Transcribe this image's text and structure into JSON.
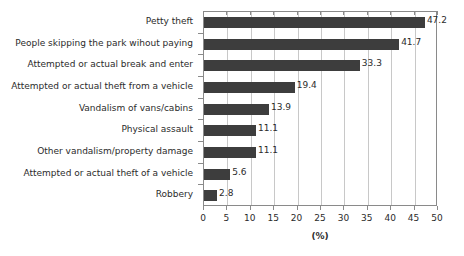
{
  "chart_data": {
    "type": "bar",
    "orientation": "horizontal",
    "title": "",
    "xlabel": "(%)",
    "ylabel": "",
    "xlim": [
      0,
      50
    ],
    "xticks": [
      0,
      5,
      10,
      15,
      20,
      25,
      30,
      35,
      40,
      45,
      50
    ],
    "xtick_labels": [
      "0",
      "5",
      "10",
      "15",
      "20",
      "25",
      "30",
      "35",
      "40",
      "45",
      "50"
    ],
    "grid": "vertical",
    "legend": "none",
    "bar_color": "#3d3d3d",
    "categories": [
      "Petty theft",
      "People skipping the park wihout paying",
      "Attempted or actual break and enter",
      "Attempted or actual theft from a vehicle",
      "Vandalism of vans/cabins",
      "Physical assault",
      "Other vandalism/property damage",
      "Attempted or actual theft of a vehicle",
      "Robbery"
    ],
    "values": [
      47.2,
      41.7,
      33.3,
      19.4,
      13.9,
      11.1,
      11.1,
      5.6,
      2.8
    ],
    "value_labels": [
      "47.2",
      "41.7",
      "33.3",
      "19.4",
      "13.9",
      "11.1",
      "11.1",
      "5.6",
      "2.8"
    ]
  }
}
